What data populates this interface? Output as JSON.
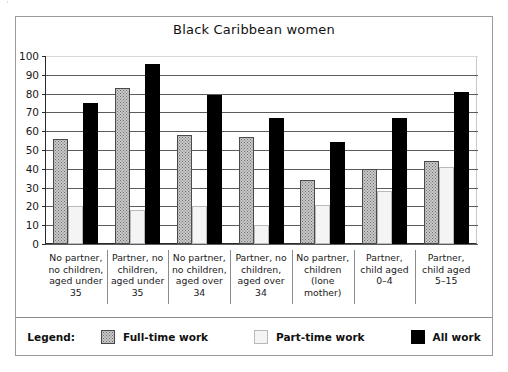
{
  "figure": {
    "title": "Black Caribbean women",
    "artifact_mark": "’"
  },
  "legend": {
    "label": "Legend:",
    "entries": [
      {
        "name": "Full-time work",
        "swatch": "dotted-grey",
        "color": "#c9c9c9"
      },
      {
        "name": "Part-time work",
        "swatch": "light-grey",
        "color": "#f4f4f4"
      },
      {
        "name": "All work",
        "swatch": "black",
        "color": "#000000"
      }
    ]
  },
  "chart_data": {
    "type": "bar",
    "title": "Black Caribbean women",
    "xlabel": "",
    "ylabel": "",
    "ylim": [
      0,
      100
    ],
    "yticks": [
      0,
      10,
      20,
      30,
      40,
      50,
      60,
      70,
      80,
      90,
      100
    ],
    "grid": true,
    "legend_position": "bottom",
    "categories": [
      "No partner, no children, aged under 35",
      "Partner, no children, aged under 35",
      "No partner, no children, aged over 34",
      "Partner, no children, aged over 34",
      "No partner, children (lone mother)",
      "Partner, child aged 0–4",
      "Partner, child aged 5–15"
    ],
    "category_lines": [
      [
        "No partner,",
        "no children,",
        "aged under",
        "35"
      ],
      [
        "Partner, no",
        "children,",
        "aged under",
        "35"
      ],
      [
        "No partner,",
        "no children,",
        "aged over",
        "34"
      ],
      [
        "Partner, no",
        "children,",
        "aged over",
        "34"
      ],
      [
        "No partner,",
        "children",
        "(lone",
        "mother)"
      ],
      [
        "Partner,",
        "child aged",
        "0–4",
        ""
      ],
      [
        "Partner,",
        "child aged",
        "5–15",
        ""
      ]
    ],
    "series": [
      {
        "name": "Full-time work",
        "values": [
          56,
          83,
          58,
          57,
          34,
          40,
          44
        ]
      },
      {
        "name": "Part-time work",
        "values": [
          20,
          18,
          20,
          10,
          21,
          28,
          41
        ]
      },
      {
        "name": "All work",
        "values": [
          75,
          96,
          79,
          67,
          54,
          67,
          81
        ]
      }
    ]
  }
}
